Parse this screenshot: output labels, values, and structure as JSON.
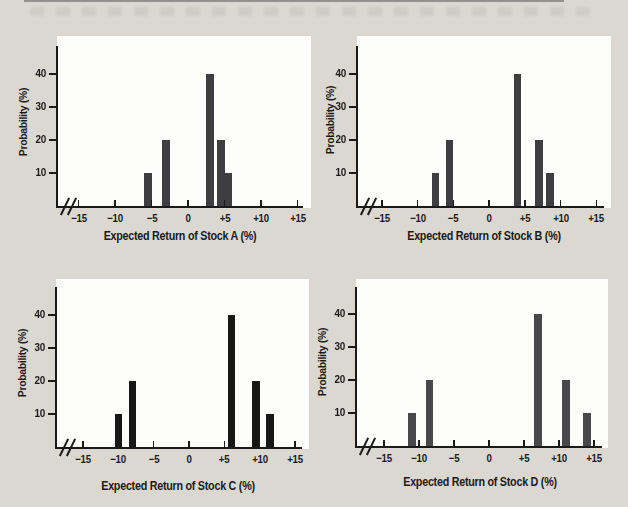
{
  "page": {
    "background_color": "#dbd8d2",
    "panel_color": "#fdfdfb",
    "ink_color": "#1a1a1a",
    "top_rule_color": "#8b8985"
  },
  "chart_data": [
    {
      "type": "bar",
      "xlabel": "Expected Return of Stock A (%)",
      "ylabel": "Probability (%)",
      "x_values": [
        -5.5,
        -3,
        3,
        4.5,
        5.5
      ],
      "probabilities_pct": [
        10,
        20,
        40,
        20,
        10
      ],
      "x_tick_values": [
        -15,
        -10,
        -5,
        0,
        5,
        10,
        15
      ],
      "x_tick_labels": [
        "−15",
        "−10",
        "−5",
        "0",
        "+5",
        "+10",
        "+15"
      ],
      "y_tick_values": [
        10,
        20,
        30,
        40
      ],
      "y_tick_labels": [
        "10",
        "20",
        "30",
        "40"
      ],
      "xlim": [
        -17.5,
        16
      ],
      "ylim": [
        0,
        48
      ],
      "grid": false,
      "legend": "none",
      "axis_break_before_first_tick": true,
      "bar_color": "#3e3e42"
    },
    {
      "type": "bar",
      "xlabel": "Expected Return of Stock B (%)",
      "ylabel": "Probability (%)",
      "x_values": [
        -7.5,
        -5.5,
        4,
        7,
        8.5
      ],
      "probabilities_pct": [
        10,
        20,
        40,
        20,
        10
      ],
      "x_tick_values": [
        -15,
        -10,
        -5,
        0,
        5,
        10,
        15
      ],
      "x_tick_labels": [
        "−15",
        "−10",
        "−5",
        "0",
        "+5",
        "+10",
        "+15"
      ],
      "y_tick_values": [
        10,
        20,
        30,
        40
      ],
      "y_tick_labels": [
        "10",
        "20",
        "30",
        "40"
      ],
      "xlim": [
        -17.5,
        16
      ],
      "ylim": [
        0,
        48
      ],
      "grid": false,
      "legend": "none",
      "axis_break_before_first_tick": true,
      "bar_color": "#3e3e42"
    },
    {
      "type": "bar",
      "xlabel": "Expected Return of Stock C (%)",
      "ylabel": "Probability (%)",
      "x_values": [
        -10,
        -8,
        6,
        9.5,
        11.5
      ],
      "probabilities_pct": [
        10,
        20,
        40,
        20,
        10
      ],
      "x_tick_values": [
        -15,
        -10,
        -5,
        0,
        5,
        10,
        15
      ],
      "x_tick_labels": [
        "−15",
        "−10",
        "−5",
        "0",
        "+5",
        "+10",
        "+15"
      ],
      "y_tick_values": [
        10,
        20,
        30,
        40
      ],
      "y_tick_labels": [
        "10",
        "20",
        "30",
        "40"
      ],
      "xlim": [
        -17.5,
        16
      ],
      "ylim": [
        0,
        48
      ],
      "grid": false,
      "legend": "none",
      "axis_break_before_first_tick": true,
      "bar_color": "#171717"
    },
    {
      "type": "bar",
      "xlabel": "Expected Return of Stock D (%)",
      "ylabel": "Probability (%)",
      "x_values": [
        -11,
        -8.5,
        7,
        11,
        14
      ],
      "probabilities_pct": [
        10,
        20,
        40,
        20,
        10
      ],
      "x_tick_values": [
        -15,
        -10,
        -5,
        0,
        5,
        10,
        15
      ],
      "x_tick_labels": [
        "−15",
        "−10",
        "−5",
        "0",
        "+5",
        "+10",
        "+15"
      ],
      "y_tick_values": [
        10,
        20,
        30,
        40
      ],
      "y_tick_labels": [
        "10",
        "20",
        "30",
        "40"
      ],
      "xlim": [
        -17.5,
        16
      ],
      "ylim": [
        0,
        48
      ],
      "grid": false,
      "legend": "none",
      "axis_break_before_first_tick": true,
      "bar_color": "#48484b"
    }
  ]
}
